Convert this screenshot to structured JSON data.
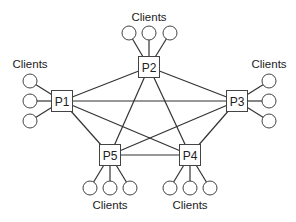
{
  "diagram": {
    "type": "network-topology",
    "nodes": [
      {
        "id": "P1",
        "label": "P1",
        "x": 62,
        "y": 101,
        "clients_label": "Clients",
        "clients": 3,
        "side": "left"
      },
      {
        "id": "P2",
        "label": "P2",
        "x": 149,
        "y": 67,
        "clients_label": "Clients",
        "clients": 3,
        "side": "top"
      },
      {
        "id": "P3",
        "label": "P3",
        "x": 237,
        "y": 101,
        "clients_label": "Clients",
        "clients": 3,
        "side": "right"
      },
      {
        "id": "P4",
        "label": "P4",
        "x": 190,
        "y": 155,
        "clients_label": "Clients",
        "clients": 3,
        "side": "bottom"
      },
      {
        "id": "P5",
        "label": "P5",
        "x": 110,
        "y": 155,
        "clients_label": "Clients",
        "clients": 3,
        "side": "bottom"
      }
    ],
    "edges": [
      [
        "P1",
        "P2"
      ],
      [
        "P1",
        "P3"
      ],
      [
        "P1",
        "P4"
      ],
      [
        "P1",
        "P5"
      ],
      [
        "P2",
        "P3"
      ],
      [
        "P2",
        "P4"
      ],
      [
        "P2",
        "P5"
      ],
      [
        "P3",
        "P4"
      ],
      [
        "P3",
        "P5"
      ],
      [
        "P4",
        "P5"
      ]
    ],
    "colors": {
      "stroke": "#333333",
      "fill": "#ffffff",
      "text": "#222222"
    }
  }
}
